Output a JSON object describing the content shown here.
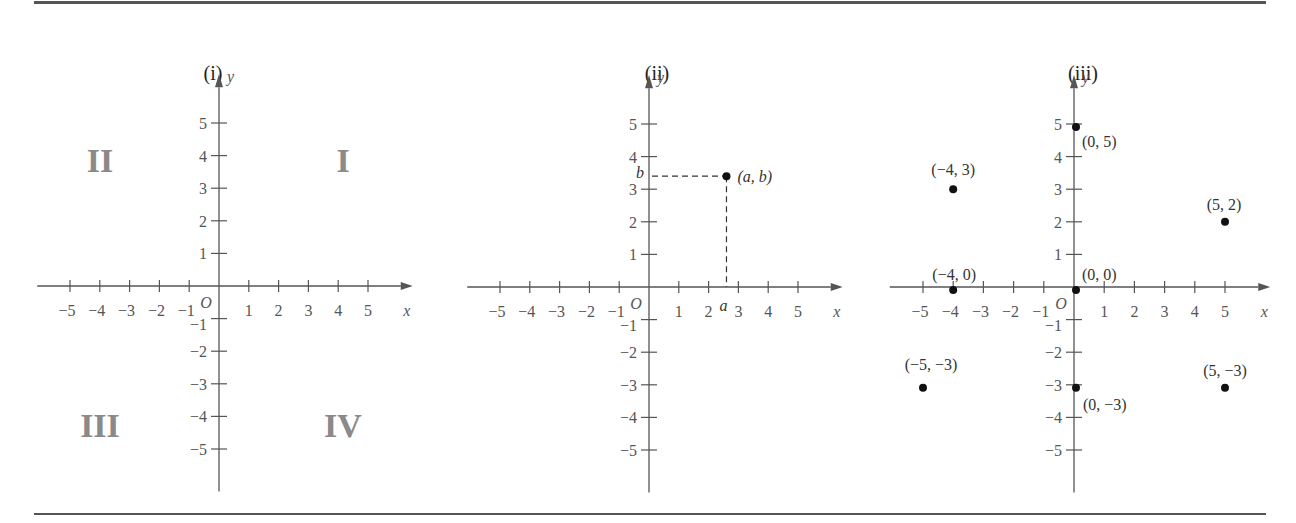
{
  "figure": {
    "panels": [
      {
        "id": "i",
        "title": "(i)",
        "x_axis_label": "x",
        "y_axis_label": "y",
        "origin_label": "O",
        "quadrant_labels": {
          "I": "I",
          "II": "II",
          "III": "III",
          "IV": "IV"
        }
      },
      {
        "id": "ii",
        "title": "(ii)",
        "x_axis_label": "x",
        "y_axis_label": "y",
        "origin_label": "O",
        "point_label": "(a, b)",
        "a_label": "a",
        "b_label": "b"
      },
      {
        "id": "iii",
        "title": "(iii)",
        "x_axis_label": "x",
        "y_axis_label": "y",
        "origin_label": "O"
      }
    ]
  },
  "chart_data": [
    {
      "type": "scatter",
      "title": "(i)",
      "xlabel": "x",
      "ylabel": "y",
      "xlim": [
        -5,
        5
      ],
      "ylim": [
        -5,
        5
      ],
      "x_ticks": [
        -5,
        -4,
        -3,
        -2,
        -1,
        1,
        2,
        3,
        4,
        5
      ],
      "y_ticks": [
        -5,
        -4,
        -3,
        -2,
        -1,
        1,
        2,
        3,
        4,
        5
      ],
      "grid": false,
      "annotations": [
        {
          "text": "I",
          "quadrant": 1
        },
        {
          "text": "II",
          "quadrant": 2
        },
        {
          "text": "III",
          "quadrant": 3
        },
        {
          "text": "IV",
          "quadrant": 4
        }
      ],
      "points": []
    },
    {
      "type": "scatter",
      "title": "(ii)",
      "xlabel": "x",
      "ylabel": "y",
      "xlim": [
        -5,
        5
      ],
      "ylim": [
        -5,
        5
      ],
      "x_ticks": [
        -5,
        -4,
        -3,
        -2,
        -1,
        1,
        2,
        3,
        4,
        5
      ],
      "y_ticks": [
        -5,
        -4,
        -3,
        -2,
        -1,
        1,
        2,
        3,
        4,
        5
      ],
      "grid": false,
      "points": [
        {
          "x": 2.6,
          "y": 3.4,
          "label": "(a, b)"
        }
      ],
      "annotations": [
        {
          "text": "a",
          "x": 2.6,
          "y": 0,
          "note": "dashed projection to x-axis"
        },
        {
          "text": "b",
          "x": 0,
          "y": 3.4,
          "note": "dashed projection to y-axis"
        }
      ]
    },
    {
      "type": "scatter",
      "title": "(iii)",
      "xlabel": "x",
      "ylabel": "y",
      "xlim": [
        -5,
        5
      ],
      "ylim": [
        -5,
        5
      ],
      "x_ticks": [
        -5,
        -4,
        -3,
        -2,
        -1,
        1,
        2,
        3,
        4,
        5
      ],
      "y_ticks": [
        -5,
        -4,
        -3,
        -2,
        -1,
        1,
        2,
        3,
        4,
        5
      ],
      "grid": false,
      "points": [
        {
          "x": 0,
          "y": 5,
          "label": "(0, 5)"
        },
        {
          "x": -4,
          "y": 3,
          "label": "(−4, 3)"
        },
        {
          "x": 5,
          "y": 2,
          "label": "(5, 2)"
        },
        {
          "x": -4,
          "y": 0,
          "label": "(−4, 0)"
        },
        {
          "x": 0,
          "y": 0,
          "label": "(0, 0)"
        },
        {
          "x": -5,
          "y": -3,
          "label": "(−5, −3)"
        },
        {
          "x": 0,
          "y": -3,
          "label": "(0, −3)"
        },
        {
          "x": 5,
          "y": -3,
          "label": "(5, −3)"
        }
      ]
    }
  ]
}
